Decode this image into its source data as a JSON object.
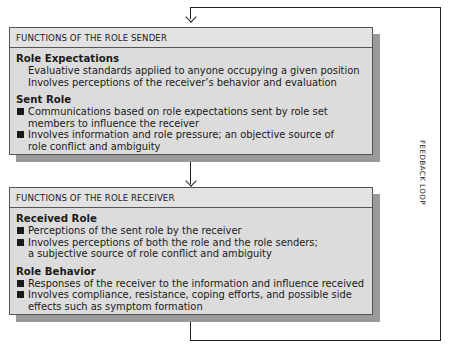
{
  "sender": {
    "header": "FUNCTIONS OF THE  ROLE SENDER",
    "sections": [
      {
        "title": "Role Expectations",
        "style": "plain",
        "items": [
          "Evaluative standards applied to anyone occupying a given position",
          "Involves perceptions of the receiver’s behavior and evaluation"
        ]
      },
      {
        "title": "Sent Role",
        "style": "bullet",
        "items": [
          [
            "Communications based on role expectations sent by role set",
            "members to influence the receiver"
          ],
          [
            "Involves information and role pressure; an objective source of",
            "role conflict and ambiguity"
          ]
        ]
      }
    ]
  },
  "receiver": {
    "header": "FUNCTIONS OF THE  ROLE RECEIVER",
    "sections": [
      {
        "title": "Received Role",
        "style": "bullet",
        "items": [
          [
            "Perceptions of the sent role by the receiver"
          ],
          [
            "Involves perceptions of both the role and the role senders;",
            "a subjective source of role conflict and ambiguity"
          ]
        ]
      },
      {
        "title": "Role Behavior",
        "style": "bullet",
        "items": [
          [
            "Responses of the receiver to the information and influence received"
          ],
          [
            "Involves compliance, resistance, coping efforts, and possible side",
            "effects such as symptom formation"
          ]
        ]
      }
    ]
  },
  "feedback_label": "FEEDBACK LOOP"
}
